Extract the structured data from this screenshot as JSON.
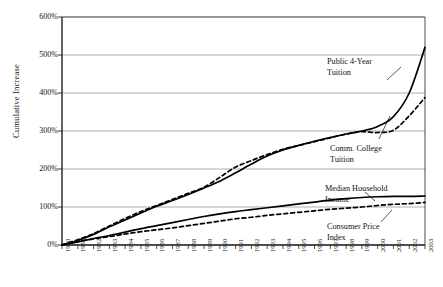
{
  "chart_data": {
    "type": "line",
    "title": "",
    "xlabel": "",
    "ylabel": "Cumulative Increase",
    "xlim": [
      1980,
      2003
    ],
    "ylim": [
      0,
      600
    ],
    "ytick_labels": [
      "0%",
      "100%",
      "200%",
      "300%",
      "400%",
      "500%",
      "600%"
    ],
    "ytick_values": [
      0,
      100,
      200,
      300,
      400,
      500,
      600
    ],
    "grid": true,
    "legend_position": "annotations-inline",
    "x": [
      1980,
      1981,
      1982,
      1983,
      1984,
      1985,
      1986,
      1987,
      1988,
      1989,
      1990,
      1991,
      1992,
      1993,
      1994,
      1995,
      1996,
      1997,
      1998,
      1999,
      2000,
      2001,
      2002,
      2003
    ],
    "xtick_labels": [
      "1980",
      "1981",
      "1982",
      "1983",
      "1984",
      "1985",
      "1986",
      "1987",
      "1988",
      "1989",
      "1990",
      "1991",
      "1992",
      "1993",
      "1994",
      "1995",
      "1996",
      "1997",
      "1998",
      "1999",
      "2000",
      "2001",
      "2002",
      "2003"
    ],
    "series": [
      {
        "name": "Public 4-Year Tuition",
        "style": "solid",
        "color": "#000000",
        "values": [
          0,
          12,
          28,
          48,
          66,
          84,
          102,
          117,
          133,
          150,
          168,
          190,
          213,
          234,
          250,
          262,
          273,
          283,
          292,
          300,
          312,
          338,
          400,
          520
        ]
      },
      {
        "name": "Comm. College Tuition",
        "style": "dashed",
        "color": "#000000",
        "values": [
          0,
          14,
          30,
          50,
          70,
          88,
          104,
          120,
          136,
          152,
          178,
          205,
          222,
          238,
          252,
          262,
          272,
          282,
          292,
          298,
          296,
          302,
          340,
          388
        ]
      },
      {
        "name": "Median Household Income",
        "style": "solid",
        "color": "#000000",
        "values": [
          0,
          8,
          17,
          25,
          34,
          43,
          51,
          59,
          67,
          75,
          82,
          88,
          93,
          98,
          103,
          108,
          113,
          118,
          122,
          125,
          127,
          128,
          128,
          129
        ]
      },
      {
        "name": "Consumer Price Index",
        "style": "dashed",
        "color": "#000000",
        "values": [
          0,
          9,
          16,
          22,
          29,
          35,
          40,
          45,
          51,
          57,
          63,
          69,
          73,
          78,
          82,
          86,
          90,
          94,
          97,
          100,
          104,
          107,
          109,
          112
        ]
      }
    ],
    "annotations": [
      {
        "id": "public-4-year",
        "text_line1": "Public 4-Year",
        "text_line2": "Tuition"
      },
      {
        "id": "comm-college",
        "text_line1": "Comm. College",
        "text_line2": "Tuition"
      },
      {
        "id": "median-household",
        "text_line1": "Median Household",
        "text_line2": "Income"
      },
      {
        "id": "cpi",
        "text_line1": "Consumer Price",
        "text_line2": "Index"
      }
    ]
  }
}
